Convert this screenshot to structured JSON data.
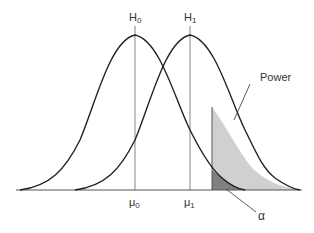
{
  "diagram": {
    "type": "hypothesis-testing-power",
    "labels": {
      "h0": {
        "base": "H",
        "sub": "0"
      },
      "h1": {
        "base": "H",
        "sub": "1"
      },
      "mu0": {
        "base": "μ",
        "sub": "0"
      },
      "mu1": {
        "base": "μ",
        "sub": "1"
      },
      "power": "Power",
      "alpha": "α"
    },
    "colors": {
      "curve": "#222222",
      "power_fill": "#d0d0d0",
      "alpha_fill": "#808080",
      "axis": "#555555",
      "mean_lines": "#666666"
    }
  }
}
